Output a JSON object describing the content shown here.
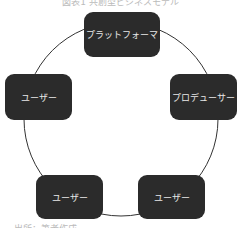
{
  "diagram": {
    "top_caption": "図表1 共創型ビジネスモデル",
    "bottom_caption": "出所：筆者作成",
    "line_color": "#333333",
    "node_color": "#2b2b2b",
    "nodes": [
      {
        "label": "プラットフォーマ"
      },
      {
        "label": "プロデューサー"
      },
      {
        "label": "ユーザー"
      },
      {
        "label": "ユーザー"
      },
      {
        "label": "ユーザー"
      }
    ]
  }
}
